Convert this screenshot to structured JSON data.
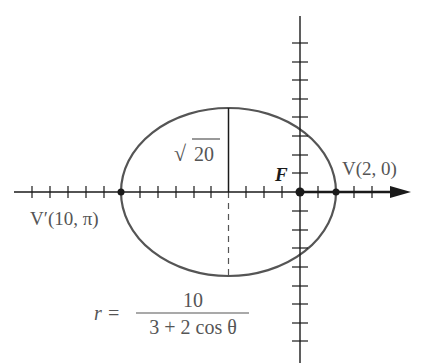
{
  "diagram": {
    "type": "polar-conic-ellipse",
    "colors": {
      "axis": "#1a1a1a",
      "curve": "#555555",
      "text": "#555555",
      "focus_label": "#1a1a1a"
    },
    "labels": {
      "focus": "F",
      "vertex": "V(2, 0)",
      "vertex_prime": "V′(10, π)",
      "minor_semi_axis": "20",
      "minor_semi_axis_prefix": "√",
      "equation_lhs": "r =",
      "equation_numerator": "10",
      "equation_denominator": "3 + 2 cos θ"
    },
    "points": {
      "focus": {
        "r": 0,
        "theta": "0"
      },
      "vertex": {
        "r": 2,
        "theta": "0"
      },
      "vertex_prime": {
        "r": 10,
        "theta": "π"
      }
    },
    "ellipse": {
      "center_x_units": -4,
      "semi_major": 6,
      "semi_minor": "√20"
    },
    "axes": {
      "x_ticks_left_of_focus": 15,
      "x_ticks_right_of_focus": 4,
      "y_ticks_above": 8,
      "y_ticks_below": 8
    }
  }
}
